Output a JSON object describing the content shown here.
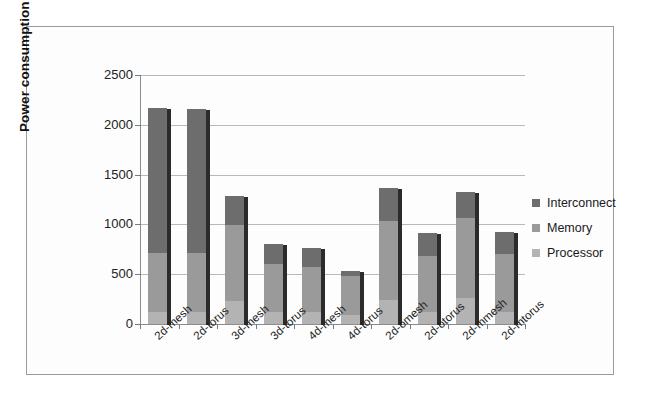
{
  "chart_data": {
    "type": "bar",
    "subtype": "stacked-vertical",
    "title": "",
    "xlabel": "",
    "ylabel": "Power consumption (W)",
    "ylim": [
      0,
      2500
    ],
    "ytick_step": 500,
    "yticks": [
      "2500",
      "2000",
      "1500",
      "1000",
      "500",
      "0"
    ],
    "grid": true,
    "legend_position": "right",
    "categories": [
      "2d-mesh",
      "2d-torus",
      "3d-mesh",
      "3d-torus",
      "4d-mesh",
      "4d-torus",
      "2d-omesh",
      "2d-otorus",
      "2d-mmesh",
      "2d-mtorus"
    ],
    "series": [
      {
        "name": "Processor",
        "color": "#b3b3b3",
        "values": [
          120,
          120,
          230,
          120,
          120,
          90,
          240,
          120,
          260,
          120
        ]
      },
      {
        "name": "Memory",
        "color": "#9a9a9a",
        "values": [
          590,
          590,
          760,
          480,
          455,
          390,
          790,
          560,
          800,
          580
        ]
      },
      {
        "name": "Interconnect",
        "color": "#6d6d6d",
        "values": [
          1460,
          1450,
          300,
          200,
          190,
          50,
          340,
          230,
          270,
          220
        ]
      }
    ],
    "totals": [
      2170,
      2160,
      1290,
      800,
      765,
      530,
      1370,
      910,
      1330,
      920
    ]
  },
  "legend": {
    "items": [
      {
        "label": "Interconnect",
        "color": "#6d6d6d"
      },
      {
        "label": "Memory",
        "color": "#9a9a9a"
      },
      {
        "label": "Processor",
        "color": "#b3b3b3"
      }
    ]
  }
}
